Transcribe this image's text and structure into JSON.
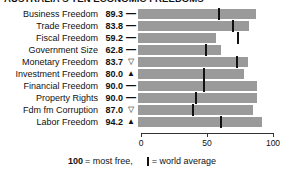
{
  "header": {
    "title": "AUSTRALIA'S TEN ECONOMIC FREEDOMS"
  },
  "footer": {
    "score_note_value": "100",
    "score_note_text": "= most free,",
    "avg_note_text": "= world average",
    "avg_icon": "vertical-bar-icon"
  },
  "markers": {
    "same": "—",
    "down": "▽",
    "up": "▲"
  },
  "colors": {
    "bar": "#9a9a9a",
    "tick": "#111111",
    "background": "#ffffff",
    "text": "#111111"
  },
  "chart_data": {
    "type": "bar",
    "title": "AUSTRALIA'S TEN ECONOMIC FREEDOMS",
    "xlabel": "",
    "ylabel": "",
    "xlim": [
      0,
      100
    ],
    "ticks": [
      0,
      50,
      100
    ],
    "tick_labels": [
      "0",
      "50",
      "100"
    ],
    "grid": false,
    "orientation": "horizontal",
    "legend": "100 = most free, | = world average",
    "categories": [
      "Business Freedom",
      "Trade Freedom",
      "Fiscal Freedom",
      "Government Size",
      "Monetary Freedom",
      "Investment Freedom",
      "Financial Freedom",
      "Property Rights",
      "Fdm fm Corruption",
      "Labor Freedom"
    ],
    "values": [
      89.3,
      83.8,
      59.2,
      62.8,
      83.7,
      80.0,
      90.0,
      90.0,
      87.0,
      94.2
    ],
    "value_labels": [
      "89.3",
      "83.8",
      "59.2",
      "62.8",
      "83.7",
      "80.0",
      "90.0",
      "90.0",
      "87.0",
      "94.2"
    ],
    "trends": [
      "same",
      "same",
      "same",
      "same",
      "down",
      "up",
      "same",
      "same",
      "down",
      "up"
    ],
    "world_average": [
      60.5,
      71.5,
      75.0,
      50.5,
      74.0,
      49.0,
      49.0,
      43.5,
      41.0,
      62.0
    ],
    "rows": [
      {
        "label": "Business Freedom",
        "value": "89.3",
        "score": 89.3,
        "trend": "same",
        "avg": 60.5
      },
      {
        "label": "Trade Freedom",
        "value": "83.8",
        "score": 83.8,
        "trend": "same",
        "avg": 71.5
      },
      {
        "label": "Fiscal Freedom",
        "value": "59.2",
        "score": 59.2,
        "trend": "same",
        "avg": 75.0
      },
      {
        "label": "Government Size",
        "value": "62.8",
        "score": 62.8,
        "trend": "same",
        "avg": 50.5
      },
      {
        "label": "Monetary Freedom",
        "value": "83.7",
        "score": 83.7,
        "trend": "down",
        "avg": 74.0
      },
      {
        "label": "Investment Freedom",
        "value": "80.0",
        "score": 80.0,
        "trend": "up",
        "avg": 49.0
      },
      {
        "label": "Financial Freedom",
        "value": "90.0",
        "score": 90.0,
        "trend": "same",
        "avg": 49.0
      },
      {
        "label": "Property Rights",
        "value": "90.0",
        "score": 90.0,
        "trend": "same",
        "avg": 43.5
      },
      {
        "label": "Fdm fm Corruption",
        "value": "87.0",
        "score": 87.0,
        "trend": "down",
        "avg": 41.0
      },
      {
        "label": "Labor Freedom",
        "value": "94.2",
        "score": 94.2,
        "trend": "up",
        "avg": 62.0
      }
    ]
  }
}
